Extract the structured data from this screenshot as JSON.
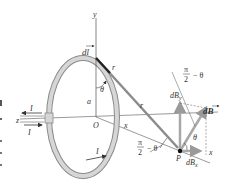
{
  "figure": {
    "labels": {
      "y_axis": "y",
      "x_axis_near": "x",
      "x_axis_far": "x",
      "z_axis": "z",
      "origin": "O",
      "radius": "a",
      "theta_top": "θ",
      "dl": "dl",
      "r_unit": "r̂",
      "r_vec": "r",
      "current_in": "I",
      "current_out": "I",
      "current_loop": "I",
      "point": "P",
      "angle_at_P_num": "π",
      "angle_at_P_den": "2",
      "angle_at_P_suffix": "− θ",
      "angle_top_num": "π",
      "angle_top_den": "2",
      "angle_top_suffix": "− θ",
      "theta_P": "θ",
      "dB": "dB",
      "dBy": "dB",
      "dBy_sub": "y",
      "dBx": "dB",
      "dBx_sub": "x",
      "x_end": "x"
    },
    "colors": {
      "loop_fill": "#d4d4d4",
      "loop_edge": "#8a8a8a",
      "r_vector": "#8c8c8c",
      "dB_vector": "#a8a8a8",
      "axis": "#444444",
      "text": "#333333"
    }
  }
}
